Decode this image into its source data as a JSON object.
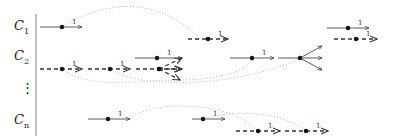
{
  "diagram": {
    "rows": [
      {
        "id": "C1",
        "label": "C",
        "subscript": "1",
        "y": 27
      },
      {
        "id": "C2",
        "label": "C",
        "subscript": "2",
        "y": 57
      },
      {
        "id": "dots",
        "label": "⋮",
        "subscript": "",
        "y": 89
      },
      {
        "id": "Cn",
        "label": "C",
        "subscript": "n",
        "y": 121
      }
    ],
    "edge_weight_label": "1",
    "colors": {
      "axis": "#888888",
      "edge": "#333333",
      "node": "#111111",
      "dotted_link": "#bbbbbb"
    },
    "solid_edges": [
      {
        "row": "C1",
        "x1": 40,
        "x2": 82,
        "y": 27,
        "node_x": 62,
        "label": "1"
      },
      {
        "row": "C2",
        "x1": 135,
        "x2": 182,
        "y": 58,
        "node_x": 157,
        "label": "1"
      },
      {
        "row": "C2",
        "x1": 230,
        "x2": 274,
        "y": 58,
        "node_x": 252,
        "label": "1"
      },
      {
        "row": "C1",
        "x1": 327,
        "x2": 369,
        "y": 28,
        "node_x": 348,
        "label": "1"
      },
      {
        "row": "Cn",
        "x1": 88,
        "x2": 130,
        "y": 119,
        "node_x": 108,
        "label": "1"
      },
      {
        "row": "Cn",
        "x1": 192,
        "x2": 225,
        "y": 119,
        "node_x": 203,
        "label": "1"
      }
    ],
    "dashed_edges": [
      {
        "row": "C1",
        "x1": 188,
        "x2": 228,
        "y": 39,
        "node_x": 208,
        "label": "1"
      },
      {
        "row": "C2",
        "x1": 40,
        "x2": 82,
        "y": 69,
        "node_x": 62,
        "label": "1"
      },
      {
        "row": "C2",
        "x1": 88,
        "x2": 130,
        "y": 69,
        "node_x": 110,
        "label": "1"
      },
      {
        "row": "C2",
        "x1": 136,
        "x2": 181,
        "y": 69,
        "node_x": 159,
        "label": ""
      },
      {
        "row": "C1",
        "x1": 334,
        "x2": 377,
        "y": 39,
        "node_x": 356,
        "label": "1"
      },
      {
        "row": "Cn",
        "x1": 236,
        "x2": 280,
        "y": 131,
        "node_x": 258,
        "label": "1"
      },
      {
        "row": "Cn",
        "x1": 285,
        "x2": 328,
        "y": 131,
        "node_x": 306,
        "label": "1"
      }
    ],
    "branch_nodes": [
      {
        "type": "dashed",
        "x": 159,
        "y": 69,
        "targets": [
          [
            182,
            58
          ],
          [
            182,
            69
          ],
          [
            180,
            80
          ]
        ]
      },
      {
        "type": "solid",
        "x": 300,
        "y": 58,
        "targets": [
          [
            322,
            46
          ],
          [
            322,
            58
          ],
          [
            322,
            70
          ]
        ]
      }
    ],
    "solid_stub": {
      "x1": 278,
      "x2": 300,
      "y": 58
    },
    "dotted_links": [
      "M 62 27 C 110 -2, 160 -2, 200 39",
      "M 62 69 C 90 90, 140 80, 180 80",
      "M 180 80 C 220 80, 250 70, 252 58",
      "M 110 69 C 150 95, 260 80, 300 58",
      "M 130 119 C 150 100, 230 100, 258 131",
      "M 203 119 C 230 110, 280 110, 306 131",
      "M 348 28 L 356 39"
    ]
  }
}
